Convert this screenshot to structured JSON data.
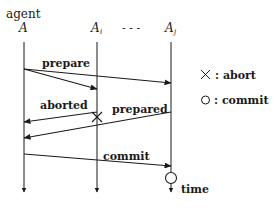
{
  "diagram": {
    "type": "sequence",
    "participants": [
      {
        "id": "A",
        "top_label": "agent",
        "label": "A",
        "x": 24
      },
      {
        "id": "Ai",
        "label": "A",
        "subscript": "i",
        "x": 97
      },
      {
        "id": "ellipsis",
        "label": "- - -",
        "x": 133
      },
      {
        "id": "Aj",
        "label": "A",
        "subscript": "j",
        "x": 171
      }
    ],
    "messages": [
      {
        "label": "prepare",
        "from": "A",
        "to": "Ai",
        "y_from": 69,
        "y_to": 89
      },
      {
        "label": "",
        "from": "A",
        "to": "Aj",
        "y_from": 69,
        "y_to": 83
      },
      {
        "label": "aborted",
        "from": "Ai",
        "to": "A",
        "y_from": 112,
        "y_to": 122
      },
      {
        "label": "prepared",
        "from": "Aj",
        "to": "A",
        "y_from": 112,
        "y_to": 138
      },
      {
        "label": "commit",
        "from": "A",
        "to": "Aj",
        "y_from": 154,
        "y_to": 166
      }
    ],
    "markers": [
      {
        "type": "abort",
        "symbol": "×",
        "on": "Ai",
        "y": 117
      },
      {
        "type": "commit",
        "symbol": "○",
        "on": "Aj",
        "y": 178
      }
    ],
    "time_label": "time",
    "legend": [
      {
        "symbol": "×",
        "text": ": abort"
      },
      {
        "symbol": "○",
        "text": ": commit"
      }
    ],
    "colors": {
      "line": "#1a1a1a",
      "background": "#ffffff"
    }
  }
}
